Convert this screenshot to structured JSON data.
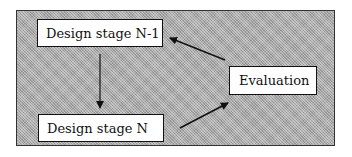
{
  "diagram": {
    "nodes": [
      {
        "id": "n1",
        "label": "Design stage N-1"
      },
      {
        "id": "n2",
        "label": "Design stage N"
      },
      {
        "id": "n3",
        "label": "Evaluation"
      }
    ],
    "edges": [
      {
        "from": "Design stage N-1",
        "to": "Design stage N"
      },
      {
        "from": "Design stage N",
        "to": "Evaluation"
      },
      {
        "from": "Evaluation",
        "to": "Design stage N-1"
      }
    ],
    "colors": {
      "background_pattern": "#a9a9a9",
      "node_fill": "#ffffff",
      "stroke": "#111111"
    }
  }
}
